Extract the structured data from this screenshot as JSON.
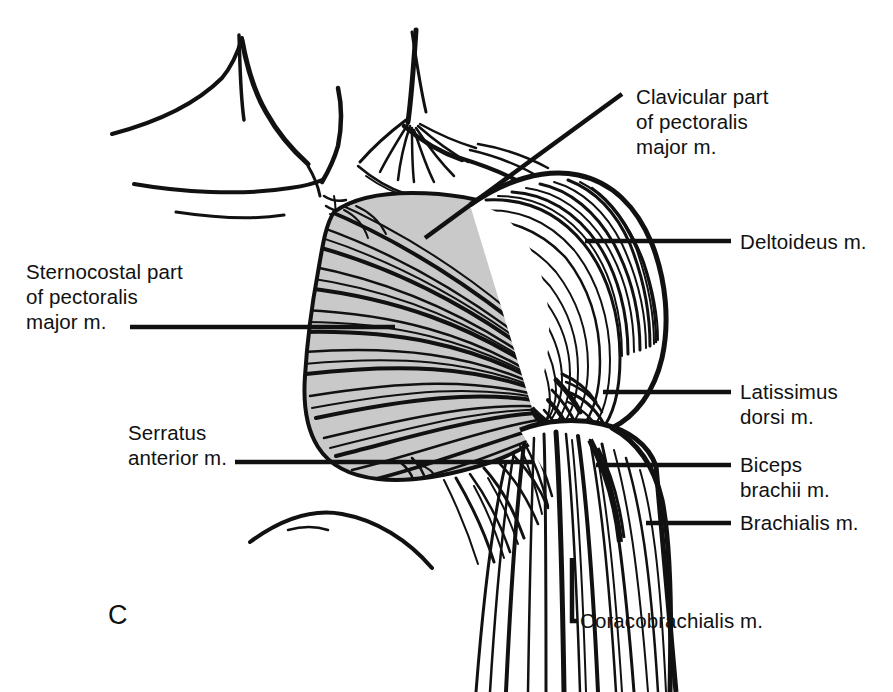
{
  "figure": {
    "panel_letter": "C",
    "background_color": "#ffffff",
    "ink_color": "#111111",
    "muscle_fill_color": "#c9c9c9"
  },
  "labels": {
    "clavicular": {
      "lines": [
        "Clavicular part",
        "of pectoralis",
        "major m."
      ],
      "text": "Clavicular part\nof pectoralis\nmajor m."
    },
    "deltoideus": {
      "lines": [
        "Deltoideus m."
      ],
      "text": "Deltoideus m."
    },
    "sternocostal": {
      "lines": [
        "Sternocostal part",
        "of pectoralis",
        "major m."
      ],
      "text": "Sternocostal part\nof pectoralis\nmajor m."
    },
    "latissimus": {
      "lines": [
        "Latissimus",
        "dorsi m."
      ],
      "text": "Latissimus\ndorsi m."
    },
    "serratus": {
      "lines": [
        "Serratus",
        "anterior m."
      ],
      "text": "Serratus\nanterior m."
    },
    "biceps": {
      "lines": [
        "Biceps",
        "brachii m."
      ],
      "text": "Biceps\nbrachii m."
    },
    "brachialis": {
      "lines": [
        "Brachialis m."
      ],
      "text": "Brachialis m."
    },
    "coracobrachialis": {
      "lines": [
        "Coracobrachialis m."
      ],
      "text": "Coracobrachialis m."
    }
  }
}
